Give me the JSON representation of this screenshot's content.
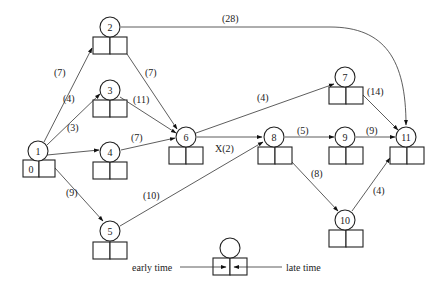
{
  "diagram": {
    "type": "activity-on-node network (critical path)",
    "nodes": [
      {
        "id": "1",
        "early_time": "0",
        "late_time": ""
      },
      {
        "id": "2",
        "early_time": "",
        "late_time": ""
      },
      {
        "id": "3",
        "early_time": "",
        "late_time": ""
      },
      {
        "id": "4",
        "early_time": "",
        "late_time": ""
      },
      {
        "id": "5",
        "early_time": "",
        "late_time": ""
      },
      {
        "id": "6",
        "early_time": "",
        "late_time": ""
      },
      {
        "id": "7",
        "early_time": "",
        "late_time": ""
      },
      {
        "id": "8",
        "early_time": "",
        "late_time": ""
      },
      {
        "id": "9",
        "early_time": "",
        "late_time": ""
      },
      {
        "id": "10",
        "early_time": "",
        "late_time": ""
      },
      {
        "id": "11",
        "early_time": "",
        "late_time": ""
      }
    ],
    "edges": [
      {
        "from": "1",
        "to": "2",
        "label": "(7)"
      },
      {
        "from": "1",
        "to": "3",
        "label": "(4)"
      },
      {
        "from": "1",
        "to": "4",
        "label": "(3)"
      },
      {
        "from": "1",
        "to": "5",
        "label": "(9)"
      },
      {
        "from": "2",
        "to": "6",
        "label": "(7)"
      },
      {
        "from": "2",
        "to": "11",
        "label": "(28)"
      },
      {
        "from": "3",
        "to": "6",
        "label": "(11)"
      },
      {
        "from": "4",
        "to": "6",
        "label": "(7)"
      },
      {
        "from": "5",
        "to": "8",
        "label": "(10)"
      },
      {
        "from": "6",
        "to": "7",
        "label": "(4)"
      },
      {
        "from": "6",
        "to": "8",
        "label": "X(2)"
      },
      {
        "from": "7",
        "to": "11",
        "label": "(14)"
      },
      {
        "from": "8",
        "to": "9",
        "label": "(5)"
      },
      {
        "from": "8",
        "to": "10",
        "label": "(8)"
      },
      {
        "from": "9",
        "to": "11",
        "label": "(9)"
      },
      {
        "from": "10",
        "to": "11",
        "label": "(4)"
      }
    ],
    "legend": {
      "early_label": "early time",
      "late_label": "late time"
    }
  }
}
